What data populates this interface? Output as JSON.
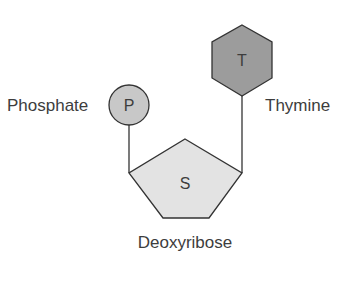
{
  "diagram": {
    "components": {
      "phosphate": {
        "symbol": "P",
        "label": "Phosphate",
        "shape": "circle",
        "fill": "#c8c8c8"
      },
      "sugar": {
        "symbol": "S",
        "label": "Deoxyribose",
        "shape": "pentagon",
        "fill": "#e3e3e3"
      },
      "base": {
        "symbol": "T",
        "label": "Thymine",
        "shape": "hexagon",
        "fill": "#9c9c9c"
      }
    },
    "colors": {
      "stroke": "#333333",
      "text": "#3d3d3d",
      "background": "#ffffff"
    }
  }
}
